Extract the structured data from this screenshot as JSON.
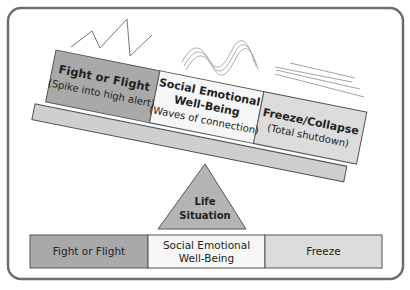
{
  "diagram": {
    "platform_blocks": [
      {
        "title": "Fight or Flight",
        "subtitle": "(Spike into high alert)",
        "fill": "#a9a9a9"
      },
      {
        "title_line1": "Social Emotional",
        "title_line2": "Well-Being",
        "subtitle": "(Waves of connection)",
        "fill": "#f6f6f6"
      },
      {
        "title": "Freeze/Collapse",
        "subtitle": "(Total shutdown)",
        "fill": "#dcdcdc"
      }
    ],
    "fulcrum": {
      "line1": "Life",
      "line2": "Situation",
      "fill": "#b4b4b4"
    },
    "bottom_row": [
      {
        "label": "Fight or Flight",
        "fill": "#a9a9a9"
      },
      {
        "label_line1": "Social Emotional",
        "label_line2": "Well-Being",
        "fill": "#f6f6f6"
      },
      {
        "label": "Freeze",
        "fill": "#dcdcdc"
      }
    ],
    "icons": {
      "fight": "zigzag-spike-icon",
      "social": "wave-lines-icon",
      "freeze": "flat-crossed-lines-icon"
    },
    "colors": {
      "frame": "#6e6e6e",
      "stroke": "#555555",
      "plank": "#cfcfcf"
    }
  }
}
